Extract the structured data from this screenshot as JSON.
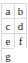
{
  "table": {
    "rows": [
      {
        "cells": [
          {
            "text": "a"
          },
          {
            "text": "b"
          }
        ]
      },
      {
        "cells": [
          {
            "text": "c"
          },
          {
            "text": "d"
          }
        ]
      },
      {
        "cells": [
          {
            "text": "e"
          },
          {
            "text": "f"
          }
        ]
      },
      {
        "cells": [
          {
            "text": "g"
          },
          {
            "text": ""
          }
        ]
      }
    ]
  },
  "colors": {
    "background": "#ffffff",
    "text": "#1b1b1b",
    "border": "#d9d9d9"
  }
}
